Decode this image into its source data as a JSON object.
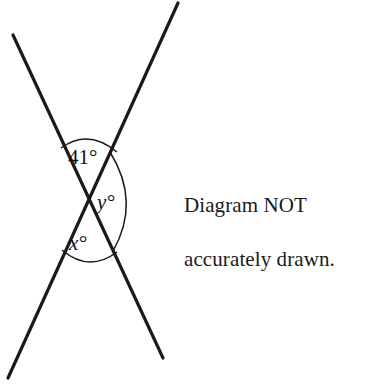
{
  "figure": {
    "background_color": "#ffffff",
    "stroke_color": "#1a1a1a",
    "line_width": 3.2,
    "arc_width": 1.4,
    "intersection": {
      "x": 85,
      "y": 202
    },
    "lines": [
      {
        "name": "line-top-left-to-bottom-right",
        "x1": 13,
        "y1": 35,
        "x2": 163,
        "y2": 358
      },
      {
        "name": "line-bottom-left-to-top-right",
        "x1": 8,
        "y1": 378,
        "x2": 178,
        "y2": 3
      }
    ],
    "angles": [
      {
        "id": "angle-top",
        "label_value": "41",
        "label_degree": "°",
        "label_full": "41°",
        "label_x": 70,
        "label_y": 163,
        "arc": "M 61 148 Q 88 128 117 152",
        "italic": false
      },
      {
        "id": "angle-right",
        "label_value": "y",
        "label_degree": "°",
        "label_full": "y°",
        "label_x": 98,
        "label_y": 208,
        "arc": "M 110 152 Q 140 202 113 251",
        "italic": true
      },
      {
        "id": "angle-bottom",
        "label_value": "x",
        "label_degree": "°",
        "label_full": "x°",
        "label_x": 70,
        "label_y": 249,
        "arc": "M 62 249 Q 89 272 117 251",
        "italic": true
      }
    ]
  },
  "note": {
    "line1": "Diagram NOT",
    "line2": "accurately drawn.",
    "color": "#1a1a1a"
  }
}
